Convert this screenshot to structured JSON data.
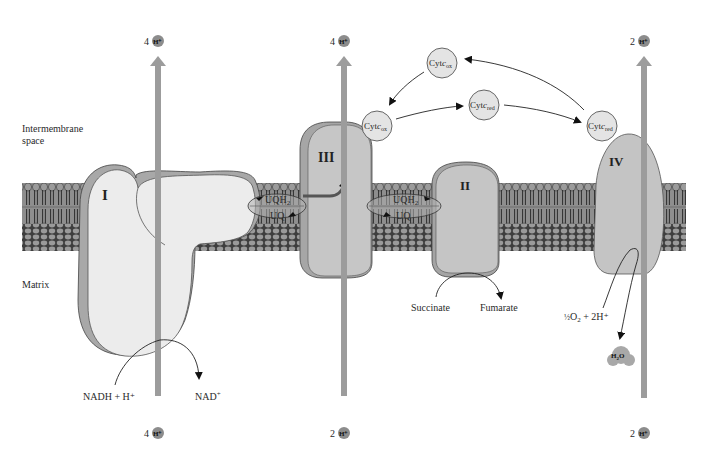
{
  "regions": {
    "intermembrane_line1": "Intermembrane",
    "intermembrane_line2": "space",
    "matrix": "Matrix"
  },
  "complexes": {
    "I": "I",
    "II": "II",
    "III": "III",
    "IV": "IV"
  },
  "proton_pumps": {
    "complex_I_top": {
      "count": "4",
      "ion": "H⁺"
    },
    "complex_I_bottom": {
      "count": "4",
      "ion": "H⁺"
    },
    "complex_III_top": {
      "count": "4",
      "ion": "H⁺"
    },
    "complex_III_bottom": {
      "count": "2",
      "ion": "H⁺"
    },
    "complex_IV_top": {
      "count": "2",
      "ion": "H⁺"
    },
    "complex_IV_bottom": {
      "count": "2",
      "ion": "H⁺"
    }
  },
  "ubiquinone": {
    "left": {
      "reduced": "UQH",
      "reduced_sub": "2",
      "oxidized": "UQ"
    },
    "right": {
      "reduced": "UQH",
      "reduced_sub": "2",
      "oxidized": "UQ"
    }
  },
  "cytochrome_c": {
    "top": {
      "base": "Cyt",
      "c": "c",
      "sub": "ox"
    },
    "left": {
      "base": "Cyt",
      "c": "c",
      "sub": "ox"
    },
    "middle": {
      "base": "Cyt",
      "c": "c",
      "sub": "red"
    },
    "right": {
      "base": "Cyt",
      "c": "c",
      "sub": "red"
    }
  },
  "reactions": {
    "complex_I_substrate": "NADH  +  H⁺",
    "complex_I_product": "NAD",
    "complex_I_product_sup": "+",
    "complex_II_substrate": "Succinate",
    "complex_II_product": "Fumarate",
    "complex_IV_half": "½",
    "complex_IV_substrate": "O",
    "complex_IV_substrate_sub": "2",
    "complex_IV_substrate_rest": " + 2H⁺",
    "complex_IV_product": "H",
    "complex_IV_product_sub": "2",
    "complex_IV_product_rest": "O"
  },
  "colors": {
    "membrane_dark": "#4a4a4a",
    "membrane_light": "#9a9a9a",
    "protein_light": "#e6e6e6",
    "protein_mid": "#c4c4c4",
    "protein_shadow": "#a6a6a6",
    "arrow_gray": "#9c9c9c",
    "proton_dot": "#8c8c8c",
    "cyt_fill": "#e2e2e2"
  }
}
